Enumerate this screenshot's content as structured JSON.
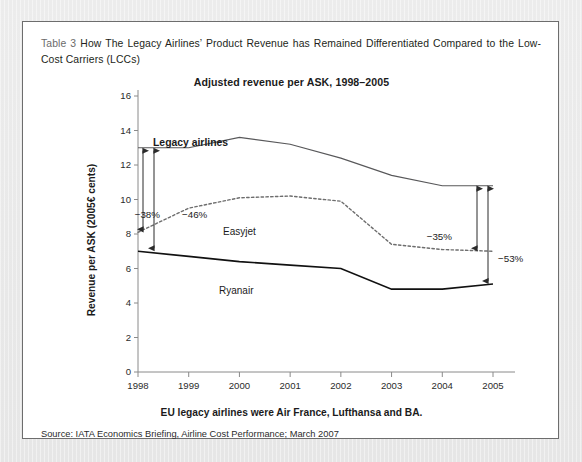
{
  "caption": {
    "table_label": "Table 3",
    "text": "How The Legacy Airlines’ Product Revenue has Remained Differentiated Compared to the Low-Cost Carriers (LCCs)"
  },
  "source_note": "Source: IATA Economics Briefing, Airline Cost Performance; March 2007",
  "xaxis_note": "EU legacy airlines were Air France, Lufthansa and BA.",
  "chart_data": {
    "type": "line",
    "title": "Adjusted revenue per ASK, 1998–2005",
    "xlabel": "",
    "ylabel": "Revenue per ASK (2005€ cents)",
    "categories": [
      "1998",
      "1999",
      "2000",
      "2001",
      "2002",
      "2003",
      "2004",
      "2005"
    ],
    "x": [
      1998,
      1999,
      2000,
      2001,
      2002,
      2003,
      2004,
      2005
    ],
    "ylim": [
      0,
      16
    ],
    "yticks": [
      0,
      2,
      4,
      6,
      8,
      10,
      12,
      14,
      16
    ],
    "grid": false,
    "legend": "inline-labels",
    "series": [
      {
        "name": "Legacy airlines",
        "style": "solid-thin",
        "color": "#58585a",
        "values": [
          13.0,
          13.0,
          13.6,
          13.2,
          12.4,
          11.4,
          10.8,
          10.8
        ]
      },
      {
        "name": "Easyjet",
        "style": "dotted",
        "color": "#6d6d6d",
        "values": [
          8.1,
          9.5,
          10.1,
          10.2,
          9.9,
          7.4,
          7.1,
          7.0
        ]
      },
      {
        "name": "Ryanair",
        "style": "solid-thick",
        "color": "#111111",
        "values": [
          7.0,
          6.7,
          6.4,
          6.2,
          6.0,
          4.8,
          4.8,
          5.1
        ]
      }
    ],
    "annotations": [
      {
        "label": "−38%",
        "year": 1998,
        "from": 13.0,
        "to": 8.1,
        "side": "left"
      },
      {
        "label": "−46%",
        "year": 1998,
        "from": 13.0,
        "to": 7.0,
        "side": "left"
      },
      {
        "label": "−35%",
        "year": 2005,
        "from": 10.8,
        "to": 7.0,
        "side": "right"
      },
      {
        "label": "−53%",
        "year": 2005,
        "from": 10.8,
        "to": 5.1,
        "side": "right"
      }
    ]
  }
}
